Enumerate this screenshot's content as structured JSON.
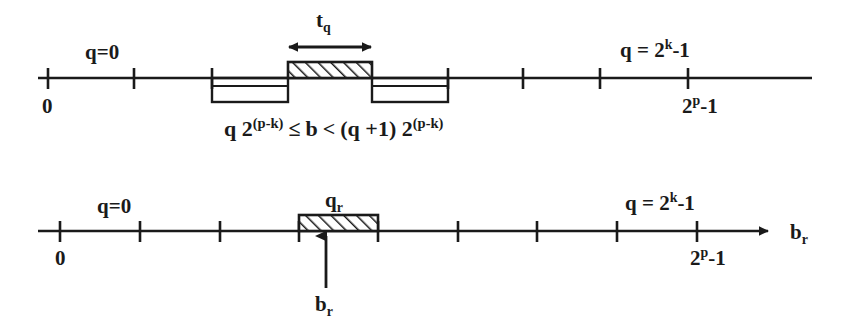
{
  "figure": {
    "background_color": "#ffffff",
    "ink_color": "#1a1a1a",
    "width": 842,
    "height": 329
  },
  "axis_top": {
    "name": "quantization-interval-axis",
    "left_label_above": "q=0",
    "left_label_below": "0",
    "right_label_above_prefix": "q = 2",
    "right_label_above_exponent": "k",
    "right_label_above_suffix": "-1",
    "right_label_below_prefix": "2",
    "right_label_below_exponent": "p",
    "right_label_below_suffix": "-1",
    "tick_count": 8,
    "highlight_box_label": "t",
    "highlight_box_label_sub": "q",
    "formula": {
      "term1_base": "q 2",
      "term1_exponent": "(p-k)",
      "relation1": "≤",
      "variable": "b",
      "relation2": "<",
      "term2_base": "(q +1) 2",
      "term2_exponent": "(p-k)"
    }
  },
  "axis_bottom": {
    "name": "reconstruction-axis",
    "left_label_above": "q=0",
    "left_label_below": "0",
    "right_label_above_prefix": "q = 2",
    "right_label_above_exponent": "k",
    "right_label_above_suffix": "-1",
    "right_label_below_prefix": "2",
    "right_label_below_exponent": "p",
    "right_label_below_suffix": "-1",
    "tick_count": 9,
    "highlight_box_label": "q",
    "highlight_box_label_sub": "r",
    "pointer_label": "b",
    "pointer_label_sub": "r",
    "axis_name_label": "b",
    "axis_name_label_sub": "r"
  }
}
